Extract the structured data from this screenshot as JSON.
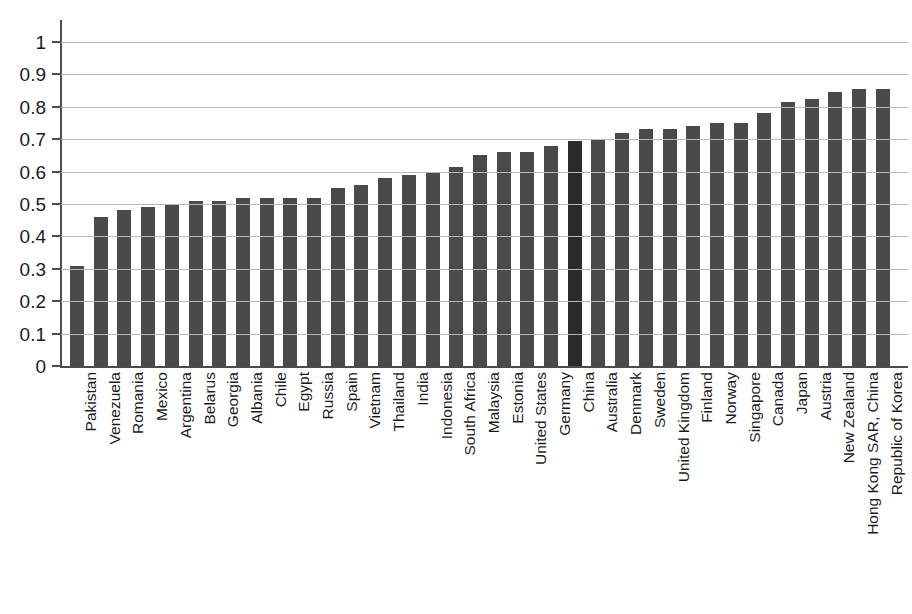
{
  "chart_data": {
    "type": "bar",
    "title": "",
    "subtitle": "",
    "xlabel": "",
    "ylabel": "",
    "ylim": [
      0,
      1
    ],
    "y_ticks": [
      "0",
      "0.1",
      "0.2",
      "0.3",
      "0.4",
      "0.5",
      "0.6",
      "0.7",
      "0.8",
      "0.9",
      "1"
    ],
    "y_tick_values": [
      0,
      0.1,
      0.2,
      0.3,
      0.4,
      0.5,
      0.6,
      0.7,
      0.8,
      0.9,
      1
    ],
    "grid": "horizontal",
    "legend": "none",
    "orientation": "vertical",
    "bar_color": "#4a4a4a",
    "highlight_color": "#2b2b2b",
    "highlight_category": "China",
    "categories": [
      "Pakistan",
      "Venezuela",
      "Romania",
      "Mexico",
      "Argentina",
      "Belarus",
      "Georgia",
      "Albania",
      "Chile",
      "Egypt",
      "Russia",
      "Spain",
      "Vietnam",
      "Thailand",
      "India",
      "Indonesia",
      "South Africa",
      "Malaysia",
      "Estonia",
      "United States",
      "Germany",
      "China",
      "Australia",
      "Denmark",
      "Sweden",
      "United Kingdom",
      "Finland",
      "Norway",
      "Singapore",
      "Canada",
      "Japan",
      "Austria",
      "New Zealand",
      "Hong Kong SAR, China",
      "Republic of Korea"
    ],
    "values": [
      0.31,
      0.46,
      0.48,
      0.49,
      0.5,
      0.51,
      0.51,
      0.52,
      0.52,
      0.52,
      0.52,
      0.55,
      0.56,
      0.58,
      0.59,
      0.6,
      0.615,
      0.65,
      0.66,
      0.66,
      0.68,
      0.695,
      0.7,
      0.72,
      0.73,
      0.73,
      0.74,
      0.75,
      0.75,
      0.78,
      0.815,
      0.825,
      0.845,
      0.855,
      0.855
    ]
  }
}
